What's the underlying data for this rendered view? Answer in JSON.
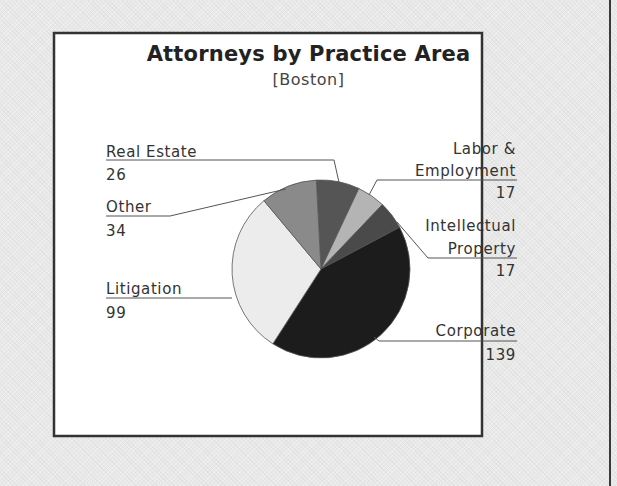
{
  "chart_data": {
    "type": "pie",
    "title": "Attorneys by Practice Area",
    "subtitle": "[Boston]",
    "slices": [
      {
        "label": "Real Estate",
        "value": 26,
        "color": "#555555"
      },
      {
        "label": "Labor & Employment",
        "value": 17,
        "color": "#b4b4b4"
      },
      {
        "label": "Intellectual Property",
        "value": 17,
        "color": "#4a4a4a"
      },
      {
        "label": "Corporate",
        "value": 139,
        "color": "#1c1c1c"
      },
      {
        "label": "Litigation",
        "value": 99,
        "color": "#ececec"
      },
      {
        "label": "Other",
        "value": 34,
        "color": "#8a8a8a"
      }
    ],
    "total": 332,
    "legend": "callout labels"
  },
  "labels": {
    "real_estate": {
      "name": "Real Estate",
      "value": "26"
    },
    "other": {
      "name": "Other",
      "value": "34"
    },
    "litigation": {
      "name": "Litigation",
      "value": "99"
    },
    "labor_line1": "Labor &",
    "labor_line2": "Employment",
    "labor_value": "17",
    "ip_line1": "Intellectual",
    "ip_line2": "Property",
    "ip_value": "17",
    "corporate": {
      "name": "Corporate",
      "value": "139"
    }
  }
}
